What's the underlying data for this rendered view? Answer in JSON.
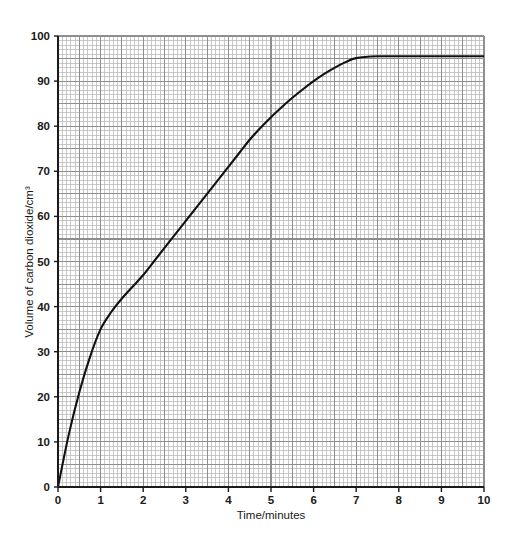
{
  "top_fragment": {
    "text": "       ,                             "
  },
  "colors": {
    "background": "#ffffff",
    "grid_minor": "#b7b7b7",
    "grid_major": "#8e8e8e",
    "axis": "#1a1a1a",
    "curve": "#111111",
    "text": "#1a1a1a"
  },
  "chart_data": {
    "type": "line",
    "title": "",
    "subtitle": "",
    "xlabel": "Time/minutes",
    "ylabel": "Volume of carbon dioxide/cm³",
    "xlim": [
      0,
      10
    ],
    "ylim": [
      0,
      100
    ],
    "x_ticks": [
      0,
      1,
      2,
      3,
      4,
      5,
      6,
      7,
      8,
      9,
      10
    ],
    "y_ticks": [
      0,
      10,
      20,
      30,
      40,
      50,
      60,
      70,
      80,
      90,
      100
    ],
    "x_tick_labels": [
      "0",
      "1",
      "2",
      "3",
      "4",
      "5",
      "6",
      "7",
      "8",
      "9",
      "10"
    ],
    "y_tick_labels": [
      "0",
      "10",
      "20",
      "30",
      "40",
      "50",
      "60",
      "70",
      "80",
      "90",
      "100"
    ],
    "x_major_step": 1,
    "x_minor_step": 0.1,
    "y_major_step": 10,
    "y_minor_step": 1,
    "grid": true,
    "grid_style": "graph-paper",
    "legend": false,
    "legend_position": "none",
    "annotations": [],
    "plateau_value": 95.5,
    "plateau_starts_at": 6.9,
    "series": [
      {
        "name": "Volume of carbon dioxide",
        "color": "#111111",
        "line_width": 2.1,
        "markers": false,
        "x": [
          0,
          0.25,
          0.5,
          0.75,
          1.0,
          1.25,
          1.5,
          1.75,
          2.0,
          2.25,
          2.5,
          2.75,
          3.0,
          3.25,
          3.5,
          3.75,
          4.0,
          4.25,
          4.5,
          4.75,
          5.0,
          5.25,
          5.5,
          5.75,
          6.0,
          6.25,
          6.5,
          6.75,
          7.0,
          7.5,
          8.0,
          8.5,
          9.0,
          9.5,
          10.0
        ],
        "y": [
          0,
          11.5,
          21.0,
          28.8,
          35.0,
          38.8,
          41.8,
          44.4,
          47.0,
          50.0,
          53.0,
          56.0,
          59.0,
          62.0,
          65.0,
          68.0,
          71.0,
          74.0,
          77.0,
          79.6,
          82.0,
          84.2,
          86.3,
          88.2,
          90.0,
          91.6,
          93.0,
          94.2,
          95.1,
          95.5,
          95.5,
          95.5,
          95.5,
          95.5,
          95.5
        ]
      }
    ]
  }
}
